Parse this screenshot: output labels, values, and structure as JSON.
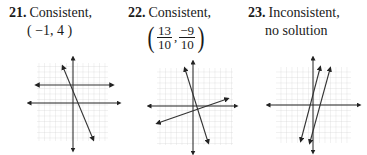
{
  "problems": [
    {
      "number": "21.",
      "status": "Consistent,",
      "solution": "( −1, 4 )",
      "graph": {
        "description": "A horizontal line and a steep negative-slope line intersecting left of the y-axis",
        "lines": [
          "horizontal",
          "steep-negative"
        ]
      }
    },
    {
      "number": "22.",
      "status": "Consistent,",
      "solution": {
        "x": {
          "numerator": "13",
          "denominator": "10"
        },
        "y": {
          "numerator": "−9",
          "denominator": "10"
        }
      },
      "graph": {
        "description": "A steep negative-slope line and a shallow positive-slope line intersecting near origin",
        "lines": [
          "steep-negative",
          "shallow-positive"
        ]
      }
    },
    {
      "number": "23.",
      "status": "Inconsistent,",
      "solution": "no solution",
      "graph": {
        "description": "Two parallel steep positive-slope lines",
        "lines": [
          "steep-positive",
          "steep-positive-parallel"
        ]
      }
    }
  ],
  "colors": {
    "text": "#1a1a1a",
    "grid": "#c8c8c8",
    "axis": "#222222",
    "line": "#333333"
  }
}
